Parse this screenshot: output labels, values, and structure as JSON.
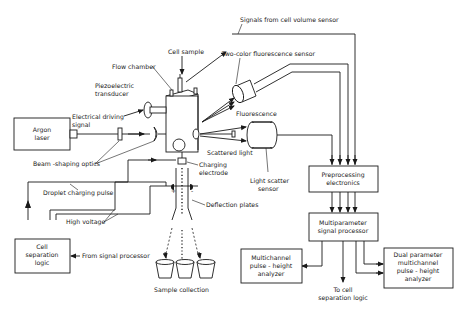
{
  "diagram": {
    "labels": {
      "signals_volume": "Signals from cell volume sensor",
      "cell_sample": "Cell sample",
      "two_color": "Two-color fluorescence sensor",
      "flow_chamber": "Flow chamber",
      "piezo_1": "Piezoelectric",
      "piezo_2": "transducer",
      "elec_drive_1": "Electrical driving",
      "elec_drive_2": "signal",
      "fluorescence": "Fluorescence",
      "scattered_light": "Scattered light",
      "charging_1": "Charging",
      "charging_2": "electrode",
      "light_scatter_1": "Light scatter",
      "light_scatter_2": "sensor",
      "beam_shaping": "Beam -shaping optics",
      "droplet_pulse": "Droplet charging pulse",
      "deflection": "Deflection plates",
      "high_voltage": "High voltage",
      "from_signal": "From signal processor",
      "sample_collection": "Sample collection",
      "to_cell_1": "To cell",
      "to_cell_2": "separation logic"
    },
    "boxes": {
      "argon_1": "Argon",
      "argon_2": "laser",
      "preproc_1": "Preprocessing",
      "preproc_2": "electronics",
      "multiparam_1": "Multiparameter",
      "multiparam_2": "signal processor",
      "cellsep_1": "Cell",
      "cellsep_2": "separation",
      "cellsep_3": "logic",
      "mca_1": "Multichannel",
      "mca_2": "pulse - height",
      "mca_3": "analyzer",
      "dual_1": "Dual parameter",
      "dual_2": "multichannel",
      "dual_3": "pulse - height",
      "dual_4": "analyzer"
    },
    "polarity": {
      "plus": "+",
      "minus": "-"
    }
  }
}
